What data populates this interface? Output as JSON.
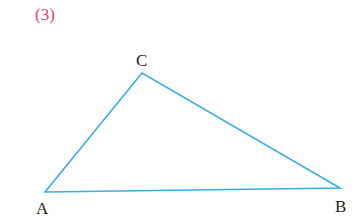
{
  "problem": {
    "number": "(3)",
    "number_color": "#e8436a"
  },
  "triangle": {
    "stroke_color": "#3aaee0",
    "vertices": {
      "A": {
        "label": "A",
        "x": 45,
        "y": 192
      },
      "B": {
        "label": "B",
        "x": 340,
        "y": 188
      },
      "C": {
        "label": "C",
        "x": 142,
        "y": 73
      }
    }
  }
}
